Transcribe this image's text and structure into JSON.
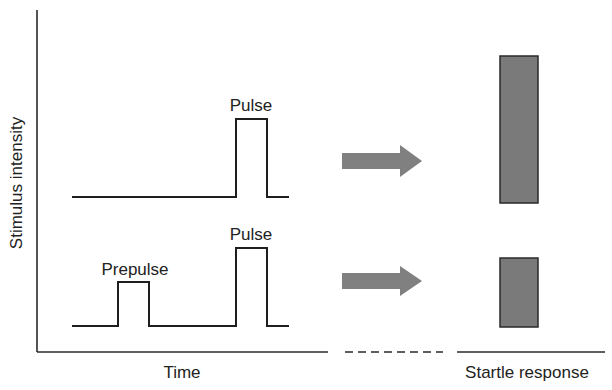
{
  "diagram": {
    "y_axis_label": "Stimulus intensity",
    "x_axis_label": "Time",
    "response_axis_label": "Startle response",
    "colors": {
      "line": "#1e1e1e",
      "arrow": "#808080",
      "bar_fill": "#7a7a7a",
      "bar_stroke": "#2a2a2a",
      "text": "#222222"
    },
    "trials": [
      {
        "name": "pulse-alone",
        "pulse_label": "Pulse",
        "has_prepulse": false,
        "response_magnitude": "large"
      },
      {
        "name": "prepulse-plus-pulse",
        "prepulse_label": "Prepulse",
        "pulse_label": "Pulse",
        "has_prepulse": true,
        "response_magnitude": "reduced"
      }
    ]
  }
}
